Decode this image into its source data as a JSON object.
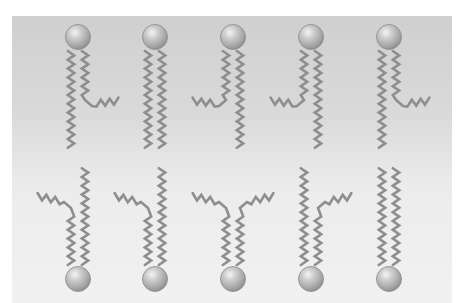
{
  "diagram": {
    "colors": {
      "background_top": "#cfcfcf",
      "background_bottom": "#f1f1f1",
      "tail": "#8e8e8e",
      "head_highlight": "#f2f2f2",
      "head_mid": "#b0b0b0",
      "head_shadow": "#8a8a8a"
    },
    "top_leaflet": [
      {
        "head_x": 78,
        "left_tail": "straight",
        "right_tail": "kinked-right"
      },
      {
        "head_x": 155,
        "left_tail": "straight",
        "right_tail": "straight"
      },
      {
        "head_x": 233,
        "left_tail": "kinked-left",
        "right_tail": "straight"
      },
      {
        "head_x": 311,
        "left_tail": "kinked-left",
        "right_tail": "straight"
      },
      {
        "head_x": 389,
        "left_tail": "straight",
        "right_tail": "kinked-right"
      }
    ],
    "bottom_leaflet": [
      {
        "head_x": 78,
        "left_tail": "kinked-left",
        "right_tail": "straight"
      },
      {
        "head_x": 155,
        "left_tail": "kinked-left",
        "right_tail": "straight"
      },
      {
        "head_x": 233,
        "left_tail": "kinked-left",
        "right_tail": "kinked-right"
      },
      {
        "head_x": 311,
        "left_tail": "straight",
        "right_tail": "kinked-right"
      },
      {
        "head_x": 389,
        "left_tail": "straight",
        "right_tail": "straight"
      }
    ]
  }
}
